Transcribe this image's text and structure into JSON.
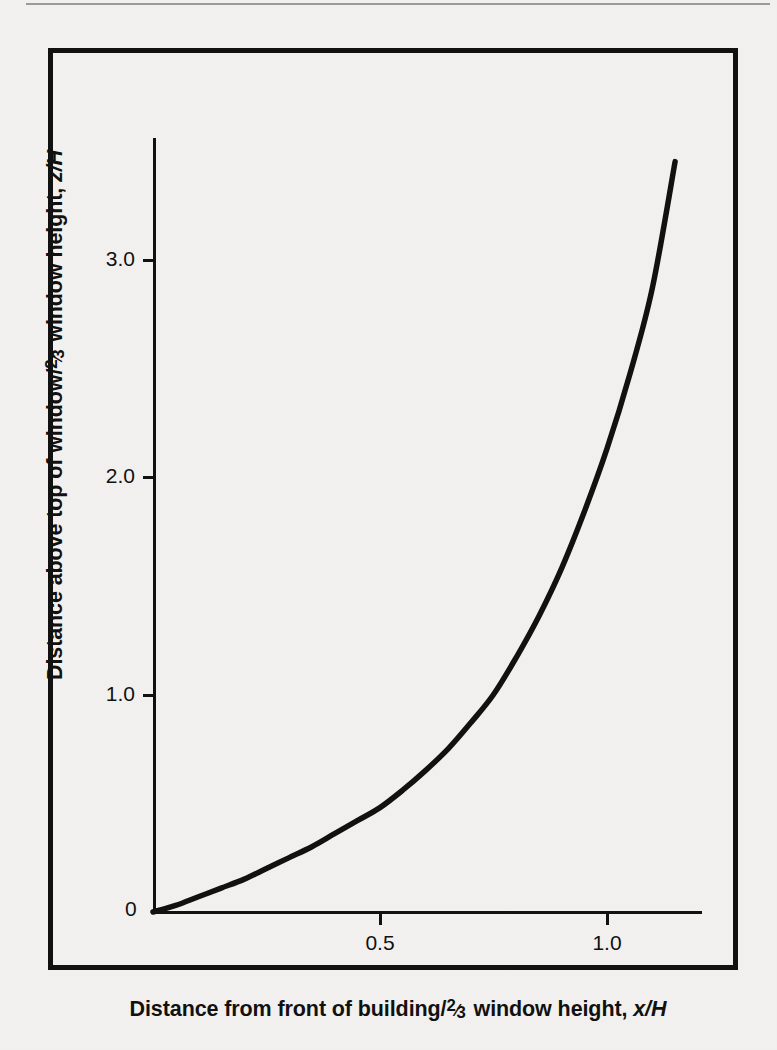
{
  "page": {
    "background_color": "#f4f3f1",
    "rule_color": "#9a9a99",
    "ink_color": "#111111"
  },
  "figure": {
    "frame_color": "#111111",
    "origin_label": "0"
  },
  "axes": {
    "x": {
      "title_prefix": "Distance from front of building/",
      "title_fraction_num": "2",
      "title_fraction_den": "3",
      "title_suffix": " window height, ",
      "title_symbol": "x/H",
      "tick_labels": [
        "0.5",
        "1.0"
      ],
      "tick_values": [
        0.5,
        1.0
      ],
      "range": [
        0,
        1.21
      ]
    },
    "y": {
      "title_prefix": "Distance above top of window/",
      "title_fraction_num": "2",
      "title_fraction_den": "3",
      "title_suffix": " window height, ",
      "title_symbol": "z/H",
      "tick_labels": [
        "1.0",
        "2.0",
        "3.0"
      ],
      "tick_values": [
        1.0,
        2.0,
        3.0
      ],
      "range": [
        0,
        3.56
      ]
    }
  },
  "chart_data": {
    "type": "line",
    "title": "",
    "xlabel": "Distance from front of building/⅔ window height, x/H",
    "ylabel": "Distance above top of window/⅔ window height, z/H",
    "xlim": [
      0,
      1.21
    ],
    "ylim": [
      0,
      3.56
    ],
    "grid": false,
    "legend": null,
    "series": [
      {
        "name": "flame/plume trajectory",
        "x": [
          0.0,
          0.05,
          0.1,
          0.15,
          0.2,
          0.25,
          0.3,
          0.35,
          0.4,
          0.45,
          0.5,
          0.55,
          0.6,
          0.65,
          0.7,
          0.75,
          0.8,
          0.85,
          0.9,
          0.95,
          1.0,
          1.05,
          1.1,
          1.15
        ],
        "y": [
          0.0,
          0.03,
          0.07,
          0.11,
          0.15,
          0.2,
          0.25,
          0.3,
          0.36,
          0.42,
          0.48,
          0.56,
          0.65,
          0.75,
          0.87,
          1.0,
          1.17,
          1.36,
          1.58,
          1.84,
          2.13,
          2.47,
          2.87,
          3.45
        ]
      }
    ]
  }
}
